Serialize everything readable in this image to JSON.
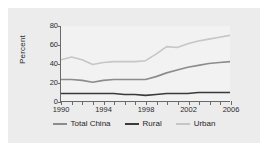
{
  "chart_data": {
    "type": "line",
    "title": "",
    "xlabel": "",
    "ylabel": "Percent",
    "xlim": [
      1990,
      2006
    ],
    "ylim": [
      0,
      80
    ],
    "yticks": [
      0,
      20,
      40,
      60,
      80
    ],
    "xticks": [
      1990,
      1994,
      1998,
      2002,
      2006
    ],
    "x": [
      1990,
      1991,
      1992,
      1993,
      1994,
      1995,
      1996,
      1997,
      1998,
      1999,
      2000,
      2001,
      2002,
      2003,
      2004,
      2005,
      2006
    ],
    "grid": false,
    "legend_position": "bottom",
    "series": [
      {
        "name": "Total China",
        "color": "#8c8c8c",
        "values": [
          23,
          23,
          22,
          20,
          22,
          23,
          23,
          23,
          23,
          26,
          30,
          33,
          36,
          38,
          40,
          41,
          42
        ]
      },
      {
        "name": "Rural",
        "color": "#3a3a3a",
        "values": [
          8,
          8,
          8,
          8,
          8,
          8,
          7,
          7,
          6,
          7,
          8,
          8,
          8,
          9,
          9,
          9,
          9
        ]
      },
      {
        "name": "Urban",
        "color": "#c6c6c6",
        "values": [
          44,
          47,
          44,
          39,
          41,
          42,
          42,
          42,
          43,
          50,
          58,
          57,
          61,
          64,
          66,
          68,
          70
        ]
      }
    ]
  },
  "axis": {
    "tick_color": "#6a6a6a",
    "text_color": "#2b2b2b"
  },
  "figure": {
    "background": "#ececed",
    "plot_background": "#f2f2f2"
  }
}
